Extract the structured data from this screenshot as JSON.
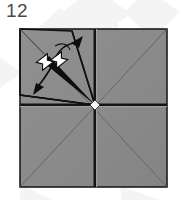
{
  "figure": {
    "step_number": "12",
    "caption": "",
    "type": "origami-fold-diagram"
  },
  "colors": {
    "page_background": "#ffffff",
    "paper_fill": "#8a8a8a",
    "paper_fill_light": "#949494",
    "paper_border": "#1a1a1a",
    "crease_line": "#5f5f5f",
    "fold_line": "#111111",
    "arrow": "#0d0d0d",
    "arrow_white_fill": "#ffffff",
    "step_number_text": "#4a4a4a",
    "watermark": "#f2f2f2"
  },
  "paper": {
    "label": "square sheet of paper",
    "left": 20,
    "top": 29,
    "width": 147,
    "height": 158,
    "center_x": 95,
    "center_y": 105
  },
  "creases": [
    {
      "name": "vertical-crease",
      "kind": "mountain",
      "x1": 95,
      "y1": 29,
      "x2": 95,
      "y2": 187
    },
    {
      "name": "horizontal-crease",
      "kind": "mountain",
      "x1": 20,
      "y1": 105,
      "x2": 167,
      "y2": 105
    },
    {
      "name": "diagonal-crease-tl-br",
      "kind": "valley",
      "x1": 20,
      "y1": 29,
      "x2": 167,
      "y2": 187
    },
    {
      "name": "diagonal-crease-tr-bl",
      "kind": "valley",
      "x1": 167,
      "y1": 29,
      "x2": 20,
      "y2": 187
    }
  ],
  "fold_flap": {
    "name": "lifted-flap-upper-left",
    "points": "20,29 72,31 95,105 20,95",
    "edges": [
      {
        "name": "flap-edge-top",
        "x1": 20,
        "y1": 29,
        "x2": 72,
        "y2": 31
      },
      {
        "name": "flap-edge-right",
        "x1": 72,
        "y1": 31,
        "x2": 95,
        "y2": 105
      },
      {
        "name": "flap-edge-bottom",
        "x1": 95,
        "y1": 105,
        "x2": 20,
        "y2": 95
      },
      {
        "name": "flap-edge-left",
        "x1": 20,
        "y1": 95,
        "x2": 20,
        "y2": 29
      }
    ]
  },
  "fold_line_bold": {
    "name": "bold-fold-line",
    "x1": 95,
    "y1": 105,
    "x2": 46,
    "y2": 60
  },
  "arrows": [
    {
      "name": "fold-arrow-up-right",
      "direction": "up-right",
      "description": "curved arrow indicating flap rotates up and to the right",
      "tip_x": 80,
      "tip_y": 38
    },
    {
      "name": "fold-arrow-down-left",
      "direction": "down-left",
      "description": "curved arrow indicating flap rotates down and to the left",
      "tip_x": 37,
      "tip_y": 92
    }
  ],
  "push_symbols": [
    {
      "name": "push-here-symbol-left",
      "x": 45,
      "y": 62,
      "rotation": -35
    },
    {
      "name": "push-here-symbol-right",
      "x": 58,
      "y": 60,
      "rotation": -35
    }
  ],
  "center_marker": {
    "name": "center-point-marker",
    "x": 95,
    "y": 105
  }
}
